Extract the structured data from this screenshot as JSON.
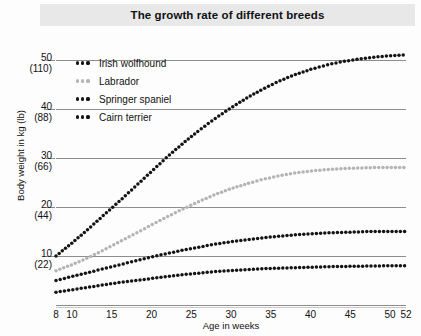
{
  "chart_data": {
    "type": "line",
    "title": "The growth rate of different breeds",
    "xlabel": "Age in weeks",
    "ylabel": "Body weight in kg (lb)",
    "xlim": [
      8,
      52
    ],
    "ylim": [
      0,
      54
    ],
    "grid": true,
    "legend_position": "upper-left-inside",
    "xticks": [
      8,
      10,
      15,
      20,
      25,
      30,
      35,
      40,
      45,
      50,
      52
    ],
    "xtick_labels": [
      "8",
      "10",
      "15",
      "20",
      "25",
      "30",
      "35",
      "40",
      "45",
      "50",
      "52"
    ],
    "yticks": [
      10,
      20,
      30,
      40,
      50
    ],
    "ytick_labels_kg": [
      "10",
      "20",
      "30",
      "40",
      "50"
    ],
    "ytick_labels_lb": [
      "(22)",
      "(44)",
      "(66)",
      "(88)",
      "(110)"
    ],
    "x": [
      8,
      10,
      12,
      14,
      16,
      18,
      20,
      22,
      24,
      26,
      28,
      30,
      32,
      34,
      36,
      38,
      40,
      42,
      44,
      46,
      48,
      50,
      52
    ],
    "series": [
      {
        "name": "Irish wolfhound",
        "color": "#141414",
        "values": [
          10.0,
          12.6,
          15.4,
          18.3,
          21.2,
          24.2,
          27.2,
          30.2,
          33.0,
          35.6,
          38.0,
          40.2,
          42.2,
          44.0,
          45.6,
          46.9,
          48.0,
          48.9,
          49.6,
          50.1,
          50.5,
          50.8,
          51.0
        ]
      },
      {
        "name": "Labrador",
        "color": "#b4b4b4",
        "values": [
          7.0,
          8.2,
          9.6,
          11.2,
          12.9,
          14.6,
          16.3,
          18.0,
          19.6,
          21.1,
          22.5,
          23.7,
          24.7,
          25.6,
          26.3,
          26.9,
          27.3,
          27.6,
          27.8,
          27.9,
          28.0,
          28.0,
          28.0
        ]
      },
      {
        "name": "Springer spaniel",
        "color": "#141414",
        "values": [
          5.0,
          5.8,
          6.6,
          7.4,
          8.2,
          9.0,
          9.8,
          10.5,
          11.2,
          11.8,
          12.4,
          12.9,
          13.3,
          13.7,
          14.0,
          14.3,
          14.5,
          14.7,
          14.8,
          14.9,
          15.0,
          15.0,
          15.0
        ]
      },
      {
        "name": "Cairn terrier",
        "color": "#141414",
        "values": [
          2.6,
          3.1,
          3.6,
          4.1,
          4.6,
          5.0,
          5.4,
          5.8,
          6.2,
          6.5,
          6.8,
          7.0,
          7.2,
          7.4,
          7.5,
          7.6,
          7.7,
          7.8,
          7.85,
          7.9,
          7.95,
          8.0,
          8.0
        ]
      }
    ]
  },
  "legend": {
    "items": [
      {
        "label": "Irish wolfhound",
        "color": "#141414"
      },
      {
        "label": "Labrador",
        "color": "#b4b4b4"
      },
      {
        "label": "Springer spaniel",
        "color": "#141414"
      },
      {
        "label": "Cairn terrier",
        "color": "#141414"
      }
    ]
  }
}
